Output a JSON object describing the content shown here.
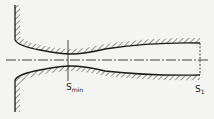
{
  "diagram": {
    "type": "converging-diverging nozzle cross-section",
    "labels": {
      "throat": {
        "main": "S",
        "sub": "min"
      },
      "exit": {
        "main": "S",
        "sub": "1"
      }
    },
    "colors": {
      "line": "#1a1a1a",
      "background": "#f4f4f2"
    }
  }
}
